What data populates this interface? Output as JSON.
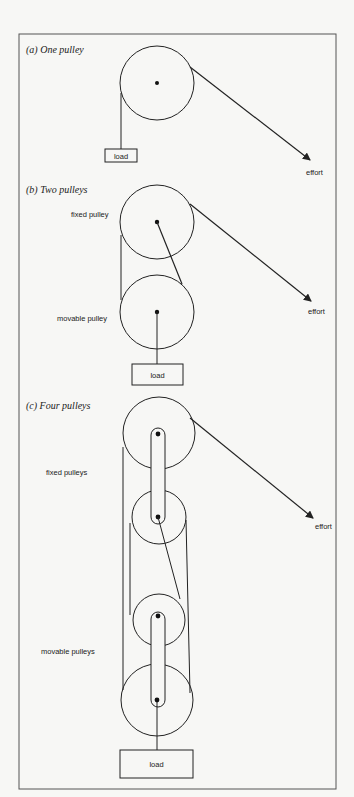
{
  "panels": [
    {
      "id": "a",
      "title": "(a)  One pulley",
      "labels": {
        "load": "load",
        "effort": "effort"
      }
    },
    {
      "id": "b",
      "title": "(b)  Two pulleys",
      "labels": {
        "fixed": "fixed pulley",
        "movable": "movable pulley",
        "load": "load",
        "effort": "effort"
      }
    },
    {
      "id": "c",
      "title": "(c)   Four pulleys",
      "labels": {
        "fixed": "fixed pulleys",
        "movable": "movable pulleys",
        "load": "load",
        "effort": "effort"
      }
    }
  ],
  "colors": {
    "background": "#f7f7f5",
    "line": "#222222",
    "frame": "#555555"
  }
}
